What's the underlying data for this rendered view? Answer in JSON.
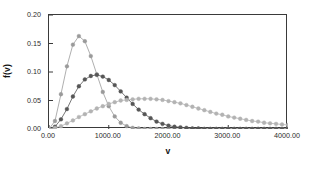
{
  "chart_data": {
    "type": "line",
    "title": "",
    "xlabel": "v",
    "ylabel": "f(v)",
    "xlim": [
      0,
      4000
    ],
    "ylim": [
      0,
      0.2
    ],
    "grid": false,
    "legend": "none",
    "marker": "filled-circle",
    "xticks": [
      0,
      1000,
      2000,
      3000,
      4000
    ],
    "xtick_labels": [
      "0.00",
      "1000.00",
      "2000.00",
      "3000.00",
      "4000.00"
    ],
    "yticks": [
      0,
      0.05,
      0.1,
      0.15,
      0.2
    ],
    "ytick_labels": [
      "0.00",
      "0.05",
      "0.10",
      "0.15",
      "0.20"
    ],
    "series": [
      {
        "name": "series-1-narrow-peak",
        "color": "#9a9a9a",
        "x": [
          0,
          100,
          200,
          300,
          400,
          500,
          600,
          700,
          800,
          900,
          1000,
          1100,
          1200,
          1300,
          1400,
          1500,
          1600,
          1700,
          1800,
          1900,
          2000,
          2100,
          2200,
          2300,
          2400,
          2500,
          2600,
          2700,
          2800,
          2900,
          3000,
          3100,
          3200,
          3300,
          3400,
          3500,
          3600,
          3700,
          3800,
          3900,
          4000
        ],
        "y": [
          0.0,
          0.014,
          0.061,
          0.11,
          0.148,
          0.163,
          0.154,
          0.128,
          0.096,
          0.065,
          0.04,
          0.022,
          0.011,
          0.005,
          0.002,
          0.001,
          0.0,
          0.0,
          0.0,
          0.0,
          0.0,
          0.0,
          0.0,
          0.0,
          0.0,
          0.0,
          0.0,
          0.0,
          0.0,
          0.0,
          0.0,
          0.0,
          0.0,
          0.0,
          0.0,
          0.0,
          0.0,
          0.0,
          0.0,
          0.0,
          0.0
        ]
      },
      {
        "name": "series-2-medium-peak",
        "color": "#565656",
        "x": [
          0,
          100,
          200,
          300,
          400,
          500,
          600,
          700,
          800,
          900,
          1000,
          1100,
          1200,
          1300,
          1400,
          1500,
          1600,
          1700,
          1800,
          1900,
          2000,
          2100,
          2200,
          2300,
          2400,
          2500,
          2600,
          2700,
          2800,
          2900,
          3000,
          3100,
          3200,
          3300,
          3400,
          3500,
          3600,
          3700,
          3800,
          3900,
          4000
        ],
        "y": [
          0.0,
          0.004,
          0.017,
          0.035,
          0.057,
          0.075,
          0.087,
          0.093,
          0.095,
          0.092,
          0.086,
          0.077,
          0.066,
          0.055,
          0.044,
          0.034,
          0.026,
          0.019,
          0.013,
          0.009,
          0.006,
          0.004,
          0.003,
          0.002,
          0.001,
          0.001,
          0.0,
          0.0,
          0.0,
          0.0,
          0.0,
          0.0,
          0.0,
          0.0,
          0.0,
          0.0,
          0.0,
          0.0,
          0.0,
          0.0,
          0.0
        ]
      },
      {
        "name": "series-3-broad-peak",
        "color": "#b3b3b3",
        "x": [
          0,
          100,
          200,
          300,
          400,
          500,
          600,
          700,
          800,
          900,
          1000,
          1100,
          1200,
          1300,
          1400,
          1500,
          1600,
          1700,
          1800,
          1900,
          2000,
          2100,
          2200,
          2300,
          2400,
          2500,
          2600,
          2700,
          2800,
          2900,
          3000,
          3100,
          3200,
          3300,
          3400,
          3500,
          3600,
          3700,
          3800,
          3900,
          4000
        ],
        "y": [
          0.0,
          0.002,
          0.005,
          0.01,
          0.015,
          0.021,
          0.026,
          0.031,
          0.036,
          0.04,
          0.044,
          0.047,
          0.05,
          0.051,
          0.052,
          0.053,
          0.053,
          0.053,
          0.052,
          0.051,
          0.049,
          0.047,
          0.045,
          0.042,
          0.039,
          0.036,
          0.033,
          0.03,
          0.027,
          0.025,
          0.022,
          0.02,
          0.018,
          0.016,
          0.014,
          0.013,
          0.011,
          0.01,
          0.009,
          0.008,
          0.007
        ]
      }
    ]
  }
}
